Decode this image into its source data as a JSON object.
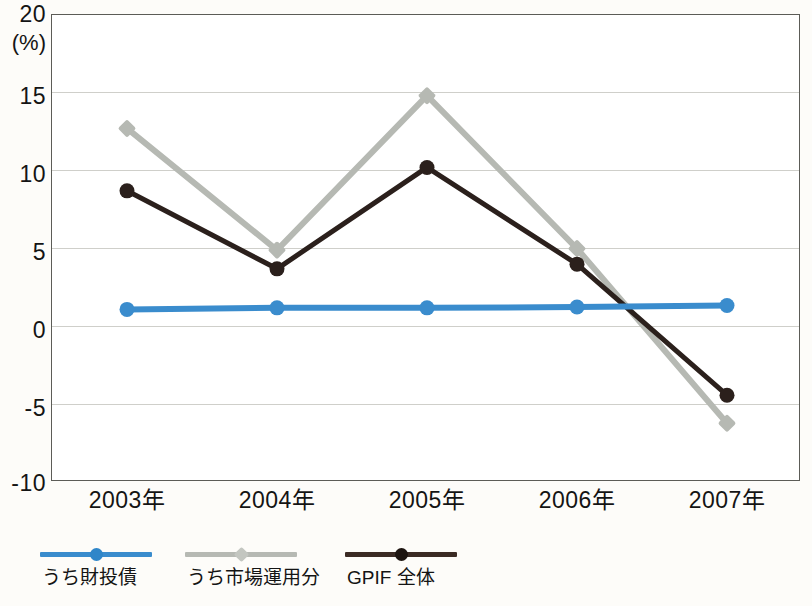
{
  "chart_data": {
    "type": "line",
    "title": "",
    "xlabel": "",
    "ylabel": "(%)",
    "unit_label": "(%)",
    "categories": [
      "2003年",
      "2004年",
      "2005年",
      "2006年",
      "2007年"
    ],
    "ylim": [
      -10,
      20
    ],
    "ytick_values": [
      20,
      15,
      10,
      5,
      0,
      -5,
      -10
    ],
    "ytick_labels": [
      "20",
      "15",
      "10",
      "5",
      "0",
      "-5",
      "-10"
    ],
    "grid": true,
    "legend_position": "bottom-left",
    "series": [
      {
        "name": "うち財投債",
        "color": "#3a8ccd",
        "marker": "circle",
        "values": [
          1.0,
          1.1,
          1.1,
          1.15,
          1.25
        ]
      },
      {
        "name": "うち市場運用分",
        "color": "#b6b9b3",
        "marker": "diamond",
        "values": [
          12.6,
          4.8,
          14.7,
          4.9,
          -6.3
        ]
      },
      {
        "name": "GPIF 全体",
        "color": "#2b201c",
        "marker": "circle",
        "values": [
          8.6,
          3.6,
          10.1,
          3.9,
          -4.5
        ]
      }
    ]
  },
  "axis": {
    "unit": "(%)"
  },
  "colors": {
    "blue": "#3a8ccd",
    "gray": "#b6b9b3",
    "black": "#2b201c",
    "grid": "#cfcfca",
    "frame": "#5c5c57",
    "background": "#fdfcf9"
  }
}
